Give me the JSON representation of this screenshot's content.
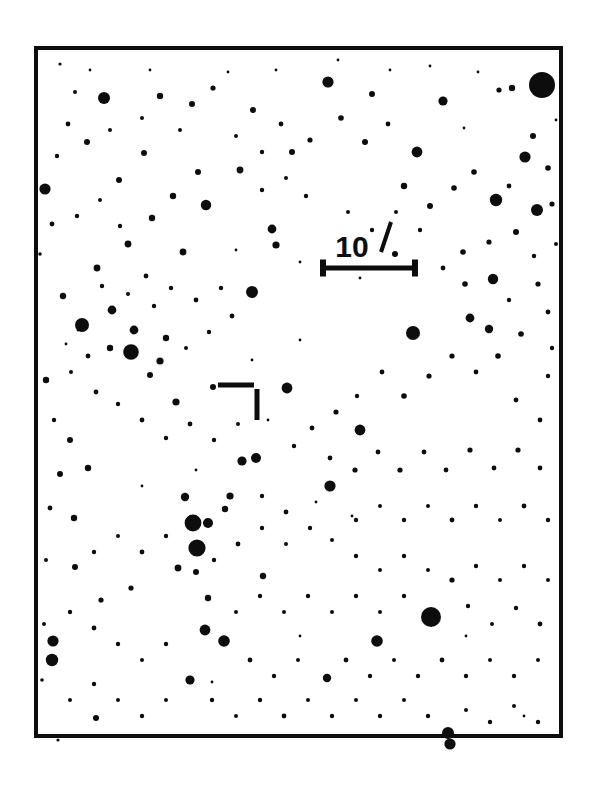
{
  "figure": {
    "kind": "astronomical-finder-chart",
    "page_width": 596,
    "page_height": 799,
    "background_color": "#ffffff",
    "ink_color": "#0d0d0d"
  },
  "frame": {
    "label": "chart-frame",
    "x": 34,
    "y": 46,
    "width": 529,
    "height": 692,
    "border_width": 4,
    "border_color": "#0d0d0d",
    "fill_color": "#ffffff"
  },
  "scale_bar": {
    "label": "10",
    "unit_symbol": "′",
    "full_label": "10′",
    "meaning": "10 arcminutes",
    "x1": 320,
    "x2": 418,
    "y": 268,
    "line_width": 5,
    "cap_height": 17,
    "cap_width": 6,
    "text_x": 352,
    "text_y": 257,
    "prime_x1": 381,
    "prime_y1": 252,
    "prime_x2": 391,
    "prime_y2": 222,
    "prime_width": 4
  },
  "target_marker": {
    "label": "target-position-marker",
    "style": "perpendicular-ticks",
    "horizontal_bar": {
      "x1": 218,
      "x2": 254,
      "y": 385,
      "thickness": 5
    },
    "vertical_bar": {
      "x": 257,
      "y1": 389,
      "y2": 420,
      "thickness": 5
    },
    "indicated_position": {
      "x": 262,
      "y": 380
    }
  },
  "chart_data": {
    "type": "scatter",
    "title": "",
    "xlabel": "",
    "ylabel": "",
    "grid": false,
    "legend": false,
    "xlim": [
      34,
      563
    ],
    "ylim": [
      46,
      738
    ],
    "point_count": 258,
    "radius_range": [
      0.8,
      13.0
    ],
    "columns": [
      "x",
      "y",
      "r"
    ],
    "stars": [
      [
        542,
        85,
        13.0
      ],
      [
        512,
        88,
        3.2
      ],
      [
        499,
        90,
        2.6
      ],
      [
        431,
        617,
        10.0
      ],
      [
        197,
        548,
        8.6
      ],
      [
        193,
        523,
        8.4
      ],
      [
        131,
        352,
        7.8
      ],
      [
        82,
        325,
        7.0
      ],
      [
        413,
        333,
        7.0
      ],
      [
        496,
        200,
        6.2
      ],
      [
        537,
        210,
        6.0
      ],
      [
        252,
        292,
        6.0
      ],
      [
        448,
        733,
        6.0
      ],
      [
        450,
        744,
        5.6
      ],
      [
        53,
        641,
        5.6
      ],
      [
        52,
        660,
        6.2
      ],
      [
        330,
        486,
        5.6
      ],
      [
        287,
        388,
        5.4
      ],
      [
        328,
        82,
        5.6
      ],
      [
        206,
        205,
        5.2
      ],
      [
        104,
        98,
        6.0
      ],
      [
        360,
        430,
        5.4
      ],
      [
        45,
        189,
        5.6
      ],
      [
        377,
        641,
        5.8
      ],
      [
        224,
        641,
        5.8
      ],
      [
        205,
        630,
        5.4
      ],
      [
        493,
        279,
        5.2
      ],
      [
        417,
        152,
        5.4
      ],
      [
        525,
        157,
        5.6
      ],
      [
        395,
        254,
        3.0
      ],
      [
        208,
        523,
        5.0
      ],
      [
        242,
        461,
        4.6
      ],
      [
        256,
        458,
        5.0
      ],
      [
        190,
        680,
        4.6
      ],
      [
        96,
        718,
        3.0
      ],
      [
        327,
        678,
        4.2
      ],
      [
        372,
        94,
        3.0
      ],
      [
        443,
        101,
        4.6
      ],
      [
        470,
        318,
        4.4
      ],
      [
        489,
        329,
        4.2
      ],
      [
        292,
        152,
        3.0
      ],
      [
        240,
        170,
        3.4
      ],
      [
        272,
        229,
        4.4
      ],
      [
        276,
        245,
        3.6
      ],
      [
        183,
        252,
        3.4
      ],
      [
        112,
        310,
        4.4
      ],
      [
        134,
        330,
        4.4
      ],
      [
        166,
        338,
        3.2
      ],
      [
        110,
        348,
        3.2
      ],
      [
        160,
        361,
        3.6
      ],
      [
        150,
        375,
        3.0
      ],
      [
        176,
        402,
        3.6
      ],
      [
        213,
        387,
        3.0
      ],
      [
        225,
        509,
        3.2
      ],
      [
        185,
        497,
        4.2
      ],
      [
        230,
        496,
        3.6
      ],
      [
        178,
        568,
        3.4
      ],
      [
        196,
        572,
        3.0
      ],
      [
        263,
        576,
        3.2
      ],
      [
        208,
        598,
        3.2
      ],
      [
        131,
        588,
        2.6
      ],
      [
        101,
        600,
        2.6
      ],
      [
        75,
        567,
        3.0
      ],
      [
        74,
        518,
        3.2
      ],
      [
        60,
        474,
        3.0
      ],
      [
        88,
        468,
        3.2
      ],
      [
        70,
        440,
        3.0
      ],
      [
        46,
        380,
        3.2
      ],
      [
        63,
        296,
        3.2
      ],
      [
        97,
        268,
        3.4
      ],
      [
        128,
        244,
        3.4
      ],
      [
        152,
        218,
        3.2
      ],
      [
        173,
        196,
        3.2
      ],
      [
        198,
        172,
        3.0
      ],
      [
        144,
        153,
        3.0
      ],
      [
        119,
        180,
        3.0
      ],
      [
        87,
        142,
        3.0
      ],
      [
        68,
        124,
        2.4
      ],
      [
        75,
        92,
        2.0
      ],
      [
        160,
        96,
        3.2
      ],
      [
        192,
        104,
        3.0
      ],
      [
        213,
        88,
        2.6
      ],
      [
        253,
        110,
        3.0
      ],
      [
        281,
        124,
        2.4
      ],
      [
        310,
        140,
        2.6
      ],
      [
        341,
        118,
        2.8
      ],
      [
        365,
        142,
        3.0
      ],
      [
        388,
        124,
        2.4
      ],
      [
        404,
        186,
        3.2
      ],
      [
        430,
        206,
        3.0
      ],
      [
        454,
        188,
        2.8
      ],
      [
        474,
        172,
        2.8
      ],
      [
        509,
        186,
        2.4
      ],
      [
        533,
        136,
        3.0
      ],
      [
        548,
        168,
        2.8
      ],
      [
        552,
        204,
        2.6
      ],
      [
        516,
        232,
        3.0
      ],
      [
        489,
        242,
        2.6
      ],
      [
        463,
        252,
        2.8
      ],
      [
        443,
        268,
        2.4
      ],
      [
        465,
        284,
        2.8
      ],
      [
        509,
        300,
        2.2
      ],
      [
        538,
        284,
        2.6
      ],
      [
        548,
        312,
        2.4
      ],
      [
        521,
        334,
        2.8
      ],
      [
        498,
        356,
        2.8
      ],
      [
        476,
        372,
        2.4
      ],
      [
        452,
        356,
        2.6
      ],
      [
        429,
        376,
        2.6
      ],
      [
        404,
        396,
        2.8
      ],
      [
        382,
        372,
        2.4
      ],
      [
        357,
        396,
        2.2
      ],
      [
        336,
        412,
        2.6
      ],
      [
        312,
        428,
        2.4
      ],
      [
        294,
        446,
        2.2
      ],
      [
        330,
        458,
        2.4
      ],
      [
        355,
        470,
        2.6
      ],
      [
        378,
        452,
        2.4
      ],
      [
        400,
        470,
        2.6
      ],
      [
        424,
        452,
        2.4
      ],
      [
        446,
        470,
        2.4
      ],
      [
        470,
        450,
        2.6
      ],
      [
        494,
        468,
        2.4
      ],
      [
        518,
        450,
        2.6
      ],
      [
        540,
        468,
        2.4
      ],
      [
        540,
        420,
        2.4
      ],
      [
        516,
        400,
        2.4
      ],
      [
        548,
        376,
        2.2
      ],
      [
        552,
        348,
        2.2
      ],
      [
        534,
        256,
        2.2
      ],
      [
        556,
        244,
        2.0
      ],
      [
        420,
        230,
        2.2
      ],
      [
        396,
        212,
        2.0
      ],
      [
        372,
        230,
        2.2
      ],
      [
        348,
        212,
        2.0
      ],
      [
        306,
        196,
        2.2
      ],
      [
        286,
        178,
        2.0
      ],
      [
        262,
        190,
        2.2
      ],
      [
        236,
        136,
        2.0
      ],
      [
        262,
        152,
        2.2
      ],
      [
        180,
        130,
        2.0
      ],
      [
        142,
        118,
        2.0
      ],
      [
        110,
        130,
        2.0
      ],
      [
        57,
        156,
        2.2
      ],
      [
        52,
        224,
        2.4
      ],
      [
        77,
        216,
        2.2
      ],
      [
        100,
        200,
        2.0
      ],
      [
        120,
        226,
        2.2
      ],
      [
        146,
        276,
        2.4
      ],
      [
        171,
        288,
        2.2
      ],
      [
        196,
        300,
        2.4
      ],
      [
        221,
        288,
        2.2
      ],
      [
        232,
        316,
        2.4
      ],
      [
        209,
        332,
        2.2
      ],
      [
        186,
        348,
        2.0
      ],
      [
        154,
        306,
        2.2
      ],
      [
        128,
        294,
        2.0
      ],
      [
        102,
        286,
        2.2
      ],
      [
        88,
        356,
        2.4
      ],
      [
        71,
        372,
        2.0
      ],
      [
        96,
        392,
        2.4
      ],
      [
        118,
        404,
        2.2
      ],
      [
        142,
        420,
        2.4
      ],
      [
        166,
        438,
        2.2
      ],
      [
        190,
        424,
        2.4
      ],
      [
        214,
        440,
        2.2
      ],
      [
        238,
        424,
        2.0
      ],
      [
        262,
        496,
        2.2
      ],
      [
        286,
        512,
        2.4
      ],
      [
        310,
        528,
        2.2
      ],
      [
        286,
        544,
        2.0
      ],
      [
        262,
        528,
        2.2
      ],
      [
        238,
        544,
        2.4
      ],
      [
        214,
        560,
        2.2
      ],
      [
        166,
        536,
        2.2
      ],
      [
        142,
        552,
        2.4
      ],
      [
        118,
        536,
        2.0
      ],
      [
        94,
        552,
        2.2
      ],
      [
        70,
        612,
        2.2
      ],
      [
        94,
        628,
        2.4
      ],
      [
        118,
        644,
        2.2
      ],
      [
        142,
        660,
        2.0
      ],
      [
        166,
        644,
        2.2
      ],
      [
        250,
        660,
        2.4
      ],
      [
        274,
        676,
        2.2
      ],
      [
        298,
        660,
        2.0
      ],
      [
        346,
        660,
        2.4
      ],
      [
        370,
        676,
        2.2
      ],
      [
        394,
        660,
        2.0
      ],
      [
        418,
        676,
        2.2
      ],
      [
        442,
        660,
        2.4
      ],
      [
        466,
        676,
        2.2
      ],
      [
        490,
        660,
        2.0
      ],
      [
        514,
        676,
        2.2
      ],
      [
        538,
        660,
        2.0
      ],
      [
        540,
        624,
        2.4
      ],
      [
        516,
        608,
        2.2
      ],
      [
        492,
        624,
        2.0
      ],
      [
        468,
        606,
        2.2
      ],
      [
        452,
        580,
        2.6
      ],
      [
        476,
        566,
        2.2
      ],
      [
        500,
        580,
        2.0
      ],
      [
        524,
        566,
        2.2
      ],
      [
        548,
        580,
        2.0
      ],
      [
        548,
        520,
        2.2
      ],
      [
        524,
        506,
        2.4
      ],
      [
        500,
        520,
        2.0
      ],
      [
        476,
        506,
        2.2
      ],
      [
        452,
        520,
        2.4
      ],
      [
        428,
        506,
        2.0
      ],
      [
        404,
        520,
        2.2
      ],
      [
        380,
        506,
        2.0
      ],
      [
        356,
        520,
        2.2
      ],
      [
        332,
        540,
        2.0
      ],
      [
        356,
        556,
        2.2
      ],
      [
        380,
        570,
        2.0
      ],
      [
        404,
        556,
        2.2
      ],
      [
        428,
        570,
        2.0
      ],
      [
        404,
        596,
        2.2
      ],
      [
        380,
        612,
        2.0
      ],
      [
        356,
        596,
        2.2
      ],
      [
        332,
        612,
        2.0
      ],
      [
        308,
        596,
        2.2
      ],
      [
        284,
        612,
        2.0
      ],
      [
        260,
        596,
        2.2
      ],
      [
        236,
        612,
        2.0
      ],
      [
        212,
        700,
        2.2
      ],
      [
        236,
        716,
        2.0
      ],
      [
        260,
        700,
        2.2
      ],
      [
        284,
        716,
        2.4
      ],
      [
        308,
        700,
        2.0
      ],
      [
        332,
        716,
        2.2
      ],
      [
        356,
        700,
        2.0
      ],
      [
        380,
        716,
        2.2
      ],
      [
        404,
        700,
        2.0
      ],
      [
        428,
        716,
        2.2
      ],
      [
        466,
        710,
        2.0
      ],
      [
        490,
        722,
        2.2
      ],
      [
        514,
        706,
        2.0
      ],
      [
        538,
        722,
        2.2
      ],
      [
        70,
        700,
        2.0
      ],
      [
        94,
        684,
        2.2
      ],
      [
        118,
        700,
        2.0
      ],
      [
        142,
        716,
        2.2
      ],
      [
        166,
        700,
        2.0
      ],
      [
        58,
        740,
        1.6
      ],
      [
        54,
        420,
        2.2
      ],
      [
        50,
        508,
        2.4
      ],
      [
        46,
        560,
        2.0
      ],
      [
        44,
        624,
        2.0
      ],
      [
        42,
        680,
        1.8
      ],
      [
        40,
        254,
        1.8
      ],
      [
        60,
        64,
        1.6
      ],
      [
        90,
        70,
        1.4
      ],
      [
        150,
        70,
        1.4
      ],
      [
        228,
        72,
        1.4
      ],
      [
        276,
        70,
        1.4
      ],
      [
        338,
        60,
        1.4
      ],
      [
        390,
        70,
        1.4
      ],
      [
        430,
        66,
        1.4
      ],
      [
        478,
        72,
        1.4
      ],
      [
        464,
        128,
        1.4
      ],
      [
        556,
        120,
        1.4
      ],
      [
        236,
        250,
        1.4
      ],
      [
        300,
        262,
        1.4
      ],
      [
        360,
        278,
        1.4
      ],
      [
        252,
        360,
        1.4
      ],
      [
        300,
        340,
        1.4
      ],
      [
        196,
        470,
        1.4
      ],
      [
        142,
        486,
        1.4
      ],
      [
        268,
        420,
        1.4
      ],
      [
        316,
        502,
        1.4
      ],
      [
        352,
        516,
        1.4
      ],
      [
        212,
        682,
        1.4
      ],
      [
        300,
        636,
        1.4
      ],
      [
        466,
        636,
        1.4
      ],
      [
        524,
        716,
        1.4
      ],
      [
        78,
        330,
        1.4
      ],
      [
        66,
        344,
        1.4
      ]
    ]
  }
}
